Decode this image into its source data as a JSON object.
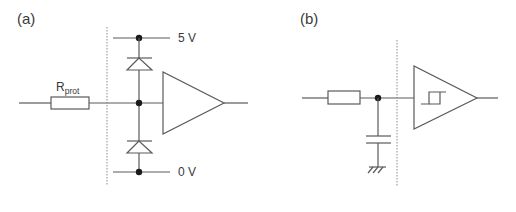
{
  "figure": {
    "panel_a": {
      "label": "(a)",
      "resistor_label_main": "R",
      "resistor_label_sub": "prot",
      "supply_high_label": "5 V",
      "supply_low_label": "0 V",
      "components": [
        "input-line",
        "protection-resistor",
        "boundary-dashed-line",
        "clamp-diode-high",
        "clamp-diode-low",
        "supply-rail-5v",
        "supply-rail-0v",
        "input-buffer-amplifier",
        "output-line"
      ]
    },
    "panel_b": {
      "label": "(b)",
      "components": [
        "input-line",
        "series-resistor",
        "filter-capacitor",
        "ground-symbol",
        "boundary-dashed-line",
        "schmitt-trigger-buffer",
        "output-line"
      ]
    },
    "colors": {
      "wire": "#5a5a5a",
      "node": "#1a1a1a",
      "text": "#3a3a3a",
      "background": "#ffffff"
    }
  }
}
